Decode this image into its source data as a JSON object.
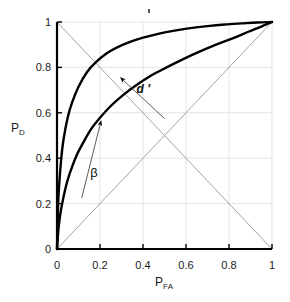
{
  "figure": {
    "background": "#ffffff",
    "width": 290,
    "height": 302
  },
  "chart_data": {
    "type": "line",
    "title": "",
    "subtitle": "",
    "xlabel": "P_FA",
    "ylabel": "P_D",
    "xlabel_base": "P",
    "xlabel_sub": "FA",
    "ylabel_base": "P",
    "ylabel_sub": "D",
    "xlim": [
      0,
      1
    ],
    "ylim": [
      0,
      1
    ],
    "xticks": [
      0,
      0.2,
      0.4,
      0.6,
      0.8,
      1
    ],
    "yticks": [
      0,
      0.2,
      0.4,
      0.6,
      0.8,
      1
    ],
    "xtick_labels": [
      "0",
      "0.2",
      "0.4",
      "0.6",
      "0.8",
      "1"
    ],
    "ytick_labels": [
      "0",
      "0.2",
      "0.4",
      "0.6",
      "0.8",
      "1"
    ],
    "grid": true,
    "grid_color": "#d8d8d8",
    "legend": "none",
    "curve_color": "#000000",
    "reference_color": "#8c8c8c",
    "series": [
      {
        "name": "ROC high d-prime",
        "kind": "roc-curve",
        "x": [
          0,
          0.005,
          0.01,
          0.02,
          0.03,
          0.05,
          0.07,
          0.1,
          0.14,
          0.18,
          0.23,
          0.28,
          0.34,
          0.4,
          0.47,
          0.54,
          0.62,
          0.7,
          0.78,
          0.86,
          0.93,
          1
        ],
        "y": [
          0,
          0.19,
          0.28,
          0.4,
          0.48,
          0.58,
          0.645,
          0.715,
          0.78,
          0.822,
          0.861,
          0.888,
          0.912,
          0.931,
          0.948,
          0.961,
          0.973,
          0.982,
          0.989,
          0.994,
          0.998,
          1
        ]
      },
      {
        "name": "ROC low d-prime",
        "kind": "roc-curve",
        "x": [
          0,
          0.005,
          0.01,
          0.02,
          0.04,
          0.06,
          0.09,
          0.12,
          0.16,
          0.2,
          0.25,
          0.31,
          0.37,
          0.44,
          0.51,
          0.58,
          0.66,
          0.74,
          0.82,
          0.89,
          0.95,
          1
        ],
        "y": [
          0,
          0.07,
          0.115,
          0.18,
          0.27,
          0.335,
          0.41,
          0.465,
          0.53,
          0.578,
          0.63,
          0.68,
          0.722,
          0.765,
          0.8,
          0.833,
          0.868,
          0.9,
          0.929,
          0.957,
          0.98,
          1
        ]
      },
      {
        "name": "chance diagonal",
        "kind": "reference-line",
        "x": [
          0,
          1
        ],
        "y": [
          0,
          1
        ]
      },
      {
        "name": "anti-diagonal",
        "kind": "reference-line",
        "x": [
          0,
          1
        ],
        "y": [
          1,
          0
        ]
      }
    ],
    "annotations": [
      {
        "name": "d-prime",
        "label": "d '",
        "label_x": 0.37,
        "label_y": 0.705,
        "arrow_from_x": 0.5,
        "arrow_from_y": 0.575,
        "arrow_to_x": 0.295,
        "arrow_to_y": 0.755,
        "style": "italic-bold"
      },
      {
        "name": "beta",
        "label": "β",
        "label_x": 0.155,
        "label_y": 0.335,
        "arrow_from_x": 0.115,
        "arrow_from_y": 0.225,
        "arrow_to_x": 0.205,
        "arrow_to_y": 0.565,
        "style": "greek"
      }
    ]
  },
  "plot_box": {
    "left": 57,
    "right": 272,
    "top": 22,
    "bottom": 249
  }
}
